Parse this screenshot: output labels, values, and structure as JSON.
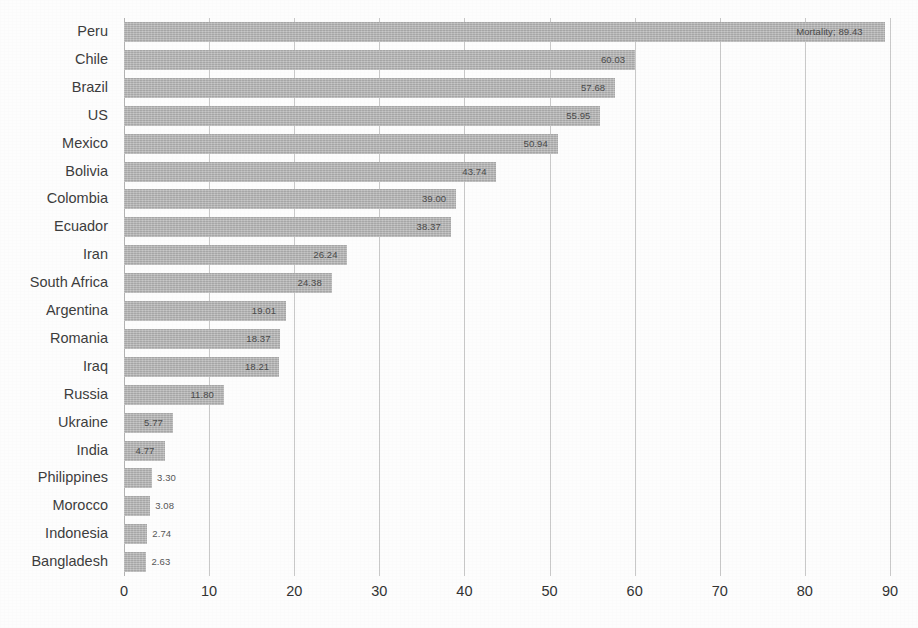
{
  "chart_data": {
    "type": "bar",
    "orientation": "horizontal",
    "title": "",
    "subtitle": "",
    "xlabel": "",
    "ylabel": "",
    "xlim": [
      0,
      90
    ],
    "xticks": [
      0,
      10,
      20,
      30,
      40,
      50,
      60,
      70,
      80,
      90
    ],
    "xtick_labels": [
      "0",
      "10",
      "20",
      "30",
      "40",
      "50",
      "60",
      "70",
      "80",
      "90"
    ],
    "grid": "vertical",
    "legend": "none",
    "series_name": "Mortality",
    "bar_color": "#b7b7b7",
    "categories": [
      "Peru",
      "Chile",
      "Brazil",
      "US",
      "Mexico",
      "Bolivia",
      "Colombia",
      "Ecuador",
      "Iran",
      "South Africa",
      "Argentina",
      "Romania",
      "Iraq",
      "Russia",
      "Ukraine",
      "India",
      "Philippines",
      "Morocco",
      "Indonesia",
      "Bangladesh"
    ],
    "values": [
      89.43,
      60.03,
      57.68,
      55.95,
      50.94,
      43.74,
      39.0,
      38.37,
      26.24,
      24.38,
      19.01,
      18.37,
      18.21,
      11.8,
      5.77,
      4.77,
      3.3,
      3.08,
      2.74,
      2.63
    ],
    "value_labels": [
      "Mortality; 89.43",
      "60.03",
      "57.68",
      "55.95",
      "50.94",
      "43.74",
      "39.00",
      "38.37",
      "26.24",
      "24.38",
      "19.01",
      "18.37",
      "18.21",
      "11.80",
      "5.77",
      "4.77",
      "3.30",
      "3.08",
      "2.74",
      "2.63"
    ]
  }
}
